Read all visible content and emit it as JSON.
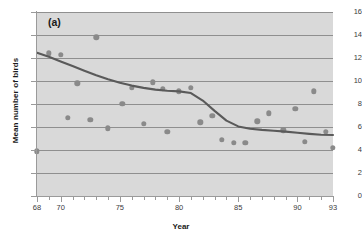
{
  "panel": {
    "tag": "(a)"
  },
  "chart_data": {
    "type": "scatter",
    "title": "",
    "panel_label": "(a)",
    "xlabel": "Year",
    "ylabel": "Mean number of birds",
    "xlim": [
      68,
      93
    ],
    "ylim": [
      0,
      16
    ],
    "grid": true,
    "legend": null,
    "colors": {
      "plot_background": "#d9d9d9",
      "gridline": "#8f8f8f",
      "point": "#8a8a8a",
      "trend_line": "#5a5a5a",
      "text": "#1a1a1a"
    },
    "xticks": [
      68,
      70,
      75,
      80,
      85,
      90,
      93
    ],
    "xtick_labels": [
      "68",
      "70",
      "75",
      "80",
      "85",
      "90",
      "93"
    ],
    "xminor_step": 1,
    "yticks": [
      0,
      2,
      4,
      6,
      8,
      10,
      12,
      14,
      16
    ],
    "ytick_labels": [
      "0",
      "2",
      "4",
      "6",
      "8",
      "10",
      "12",
      "14",
      "16"
    ],
    "x": [
      68,
      69,
      70,
      70.6,
      71.4,
      72.5,
      73,
      74,
      75.2,
      76,
      77,
      77.8,
      78.6,
      79,
      80,
      81,
      81.8,
      82.8,
      83.6,
      84.6,
      85.6,
      86.6,
      87.6,
      88.8,
      89.8,
      90.6,
      91.4,
      92.4,
      93
    ],
    "y": [
      3.9,
      12.4,
      12.3,
      6.8,
      9.8,
      6.6,
      13.8,
      5.9,
      8.0,
      9.4,
      6.3,
      9.9,
      9.3,
      5.6,
      9.1,
      9.4,
      6.4,
      7.0,
      4.9,
      4.6,
      4.6,
      6.5,
      7.2,
      5.7,
      7.6,
      4.7,
      9.1,
      5.6,
      4.2
    ],
    "series": [
      {
        "name": "Mean number of birds",
        "points": [
          [
            68,
            3.9
          ],
          [
            69,
            12.4
          ],
          [
            70,
            12.3
          ],
          [
            70.6,
            6.8
          ],
          [
            71.4,
            9.8
          ],
          [
            72.5,
            6.6
          ],
          [
            73,
            13.8
          ],
          [
            74,
            5.9
          ],
          [
            75.2,
            8.0
          ],
          [
            76,
            9.4
          ],
          [
            77,
            6.3
          ],
          [
            77.8,
            9.9
          ],
          [
            78.6,
            9.3
          ],
          [
            79,
            5.6
          ],
          [
            80,
            9.1
          ],
          [
            81,
            9.4
          ],
          [
            81.8,
            6.4
          ],
          [
            82.8,
            7.0
          ],
          [
            83.6,
            4.9
          ],
          [
            84.6,
            4.6
          ],
          [
            85.6,
            4.6
          ],
          [
            86.6,
            6.5
          ],
          [
            87.6,
            7.2
          ],
          [
            88.8,
            5.7
          ],
          [
            89.8,
            7.6
          ],
          [
            90.6,
            4.7
          ],
          [
            91.4,
            9.1
          ],
          [
            92.4,
            5.6
          ],
          [
            93,
            4.2
          ]
        ]
      }
    ],
    "trend_line": {
      "name": "smoothed trend",
      "points": [
        [
          68,
          12.45
        ],
        [
          69,
          12.1
        ],
        [
          70,
          11.7
        ],
        [
          71,
          11.3
        ],
        [
          72,
          10.9
        ],
        [
          73,
          10.5
        ],
        [
          74,
          10.15
        ],
        [
          75,
          9.85
        ],
        [
          76,
          9.6
        ],
        [
          77,
          9.4
        ],
        [
          78,
          9.25
        ],
        [
          79,
          9.15
        ],
        [
          80,
          9.1
        ],
        [
          81,
          8.95
        ],
        [
          82,
          8.3
        ],
        [
          83,
          7.4
        ],
        [
          84,
          6.55
        ],
        [
          85,
          6.05
        ],
        [
          86,
          5.85
        ],
        [
          87,
          5.75
        ],
        [
          88,
          5.68
        ],
        [
          89,
          5.6
        ],
        [
          90,
          5.5
        ],
        [
          91,
          5.4
        ],
        [
          92,
          5.32
        ],
        [
          93,
          5.3
        ]
      ]
    }
  }
}
